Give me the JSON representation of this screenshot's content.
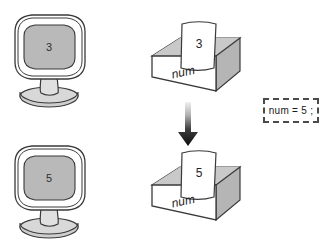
{
  "figure": {
    "background_color": "#ffffff"
  },
  "colors": {
    "outline": "#3a3a3a",
    "screen_fill": "#b9b9b9",
    "box_front_fill": "#ffffff",
    "box_side_fill": "#b5b5b5",
    "box_rim_fill": "#cfcfcf",
    "paper_fill": "#ffffff",
    "stand_fill": "#d8d8d8",
    "arrow_top": "#e9e9e9",
    "arrow_bottom": "#0d0d0d",
    "chip_border": "#4a4a4a",
    "text": "#1a1a1a"
  },
  "before": {
    "monitor": {
      "name": "monitor-before",
      "screen_value": "3"
    },
    "box": {
      "name": "variable-box-before",
      "label": "num",
      "paper_value": "3"
    }
  },
  "after": {
    "monitor": {
      "name": "monitor-after",
      "screen_value": "5"
    },
    "box": {
      "name": "variable-box-after",
      "label": "num",
      "paper_value": "5"
    }
  },
  "arrow": {
    "name": "down-arrow",
    "direction": "down"
  },
  "code": {
    "statement": "num = 5 ;"
  }
}
